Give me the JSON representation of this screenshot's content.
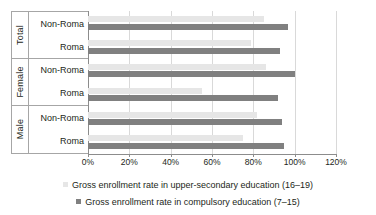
{
  "chart_data": {
    "type": "bar",
    "orientation": "horizontal",
    "title": "",
    "xlabel": "",
    "ylabel": "",
    "xlim": [
      0,
      120
    ],
    "xticks": [
      "0%",
      "20%",
      "40%",
      "60%",
      "80%",
      "100%",
      "120%"
    ],
    "xtick_values": [
      0,
      20,
      40,
      60,
      80,
      100,
      120
    ],
    "grid": true,
    "legend_position": "bottom",
    "groups": [
      {
        "name": "Total",
        "categories": [
          "Non-Roma",
          "Roma"
        ]
      },
      {
        "name": "Female",
        "categories": [
          "Non-Roma",
          "Roma"
        ]
      },
      {
        "name": "Male",
        "categories": [
          "Non-Roma",
          "Roma"
        ]
      }
    ],
    "categories": [
      "Total Non-Roma",
      "Total Roma",
      "Female Non-Roma",
      "Female Roma",
      "Male Non-Roma",
      "Male Roma"
    ],
    "series": [
      {
        "name": "Gross enrollment rate in upper-secondary education (16–19)",
        "color": "#e6e6e6",
        "values": [
          85,
          79,
          86,
          55,
          82,
          75
        ]
      },
      {
        "name": "Gross enrollment rate in compulsory education (7–15)",
        "color": "#808080",
        "values": [
          97,
          93,
          100,
          92,
          94,
          95
        ]
      }
    ]
  },
  "legend": {
    "items": [
      {
        "label": "Gross enrollment rate in upper-secondary education (16–19)",
        "color": "#e6e6e6"
      },
      {
        "label": "Gross enrollment rate in compulsory education (7–15)",
        "color": "#808080"
      }
    ]
  },
  "colors": {
    "upper_secondary": "#e6e6e6",
    "compulsory": "#808080",
    "grid": "#d9d9d9",
    "axis": "#8c8c8c",
    "text": "#231f20"
  }
}
